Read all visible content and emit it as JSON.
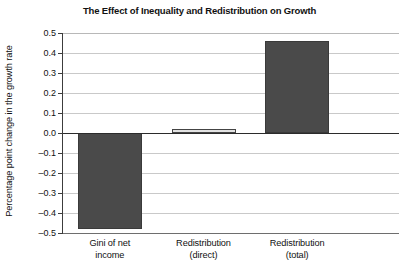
{
  "chart_data": {
    "type": "bar",
    "title": "The Effect of Inequality and Redistribution on Growth",
    "xlabel": "",
    "ylabel": "Percentage point change in the growth rate",
    "categories": [
      "Gini of net\nincome",
      "Redistribution\n(direct)",
      "Redistribution\n(total)"
    ],
    "category_lines": [
      [
        "Gini of net",
        "income"
      ],
      [
        "Redistribution",
        "(direct)"
      ],
      [
        "Redistribution",
        "(total)"
      ]
    ],
    "values": [
      -0.48,
      0.02,
      0.46
    ],
    "ylim": [
      -0.5,
      0.5
    ],
    "ytick_step": 0.1,
    "ytick_labels": [
      "0.5",
      "0.4",
      "0.3",
      "0.2",
      "0.1",
      "0.0",
      "–0.1",
      "–0.2",
      "–0.3",
      "–0.4",
      "–0.5"
    ],
    "ytick_values": [
      0.5,
      0.4,
      0.3,
      0.2,
      0.1,
      0.0,
      -0.1,
      -0.2,
      -0.3,
      -0.4,
      -0.5
    ],
    "grid": true,
    "legend": false,
    "bar_colors": [
      "#4a4a4a",
      "#e2e2e2",
      "#4a4a4a"
    ],
    "bar_edge_colors": [
      "#3a3a3a",
      "#444444",
      "#3a3a3a"
    ],
    "zero_line_color": "#2b2b2b",
    "gridline_color": "#c9c9c9",
    "axis_color": "#3c3c3c",
    "background": "#ffffff"
  }
}
